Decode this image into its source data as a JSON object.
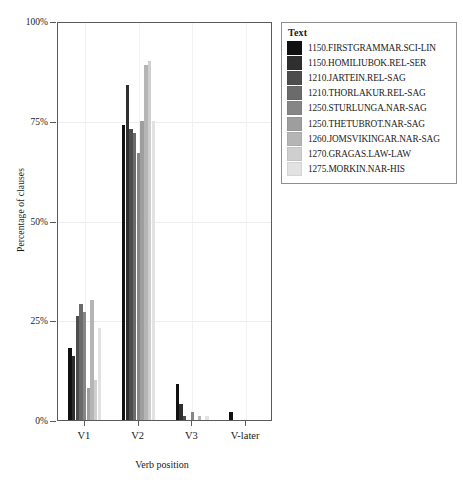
{
  "chart_data": {
    "type": "bar",
    "title": "",
    "subtitle": "",
    "xlabel": "Verb position",
    "ylabel": "Percentage of clauses",
    "categories": [
      "V1",
      "V2",
      "V3",
      "V-later"
    ],
    "ylim": [
      0,
      100
    ],
    "yticks": [
      0,
      25,
      50,
      75,
      100
    ],
    "ytick_labels": [
      "0%",
      "25%",
      "50%",
      "75%",
      "100%"
    ],
    "grid": true,
    "legend_position": "right",
    "legend_title": "Text",
    "unit": "%",
    "series": [
      {
        "name": "1150.FIRSTGRAMMAR.SCI-LIN",
        "color": "#111111",
        "values": [
          18,
          74,
          9,
          2
        ]
      },
      {
        "name": "1150.HOMILIUBOK.REL-SER",
        "color": "#2f2f2f",
        "values": [
          16,
          84,
          4,
          0
        ]
      },
      {
        "name": "1210.JARTEIN.REL-SAG",
        "color": "#4d4d4d",
        "values": [
          26,
          73,
          1,
          0
        ]
      },
      {
        "name": "1210.THORLAKUR.REL-SAG",
        "color": "#6b6b6b",
        "values": [
          29,
          72,
          0,
          0
        ]
      },
      {
        "name": "1250.STURLUNGA.NAR-SAG",
        "color": "#868686",
        "values": [
          27,
          67,
          2,
          0
        ]
      },
      {
        "name": "1250.THETUBROT.NAR-SAG",
        "color": "#9e9e9e",
        "values": [
          8,
          75,
          0,
          0
        ]
      },
      {
        "name": "1260.JOMSVIKINGAR.NAR-SAG",
        "color": "#b5b5b5",
        "values": [
          30,
          89,
          1,
          0
        ]
      },
      {
        "name": "1270.GRAGAS.LAW-LAW",
        "color": "#cfcfcf",
        "values": [
          10,
          90,
          0,
          0
        ]
      },
      {
        "name": "1275.MORKIN.NAR-HIS",
        "color": "#e2e2e2",
        "values": [
          23,
          75,
          1,
          0
        ]
      }
    ]
  }
}
